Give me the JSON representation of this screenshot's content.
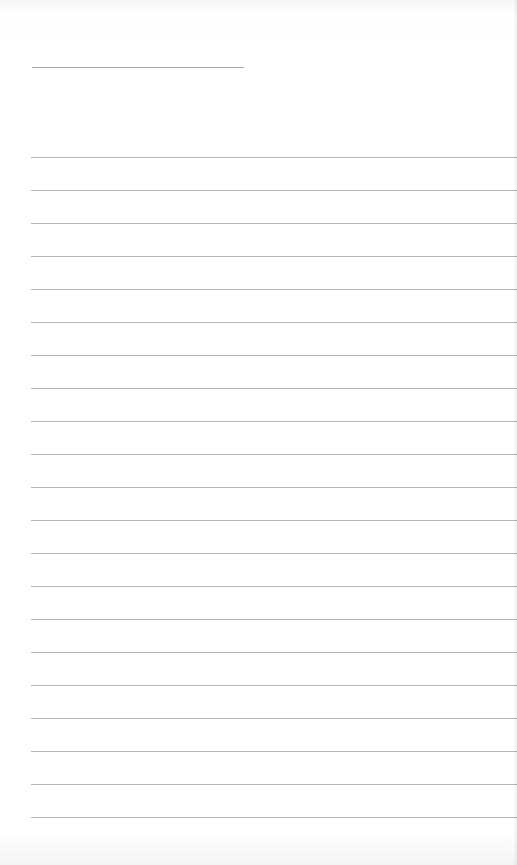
{
  "page": {
    "type": "blank ruled notepad page",
    "background_color": "#ffffff",
    "line_color": "#b4b4b4"
  },
  "title_line": {
    "x": 32,
    "y": 67,
    "width": 212
  },
  "ruled_lines": {
    "count": 21,
    "start_y": 157,
    "spacing": 33,
    "x": 31
  }
}
